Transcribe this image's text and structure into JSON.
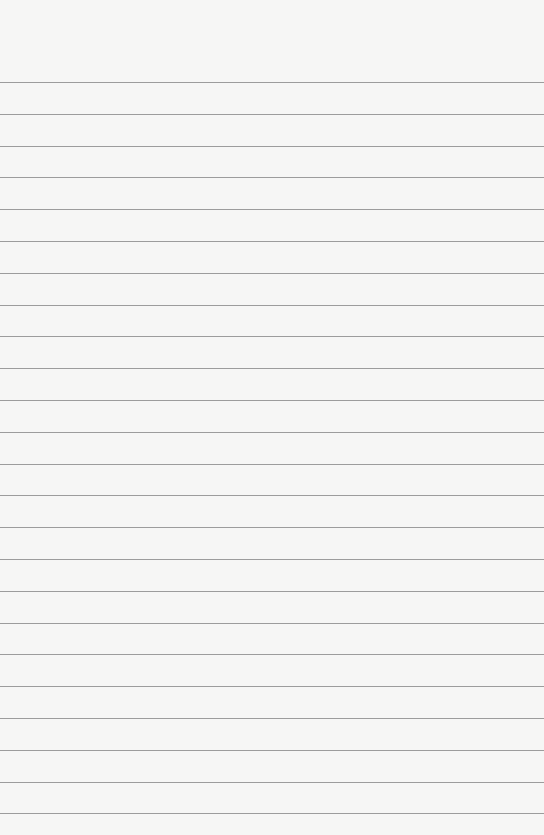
{
  "paper": {
    "type": "lined-paper",
    "background_color": "#f6f6f5",
    "line_color": "#9c9c9c",
    "first_line_y": 82,
    "line_spacing": 31.8,
    "line_count": 24
  }
}
